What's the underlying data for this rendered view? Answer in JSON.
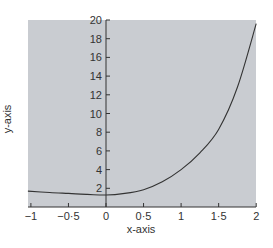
{
  "chart_data": {
    "type": "line",
    "title": "",
    "xlabel": "x-axis",
    "ylabel": "y-axis",
    "xlim": [
      -1,
      2
    ],
    "ylim": [
      0,
      20
    ],
    "grid": false,
    "legend": null,
    "background_color": "#c9ccd1",
    "line_color": "#333333",
    "x_ticks": [
      {
        "value": -1,
        "label": "−1"
      },
      {
        "value": -0.5,
        "label": "−0·5"
      },
      {
        "value": 0,
        "label": "0"
      },
      {
        "value": 0.5,
        "label": "0·5"
      },
      {
        "value": 1,
        "label": "1"
      },
      {
        "value": 1.5,
        "label": "1·5"
      },
      {
        "value": 2,
        "label": "2"
      }
    ],
    "y_ticks": [
      {
        "value": 2,
        "label": "2"
      },
      {
        "value": 4,
        "label": "4"
      },
      {
        "value": 6,
        "label": "6"
      },
      {
        "value": 8,
        "label": "8"
      },
      {
        "value": 10,
        "label": "10"
      },
      {
        "value": 12,
        "label": "12"
      },
      {
        "value": 14,
        "label": "14"
      },
      {
        "value": 16,
        "label": "16"
      },
      {
        "value": 18,
        "label": "18"
      },
      {
        "value": 20,
        "label": "20"
      }
    ],
    "series": [
      {
        "name": "curve",
        "x": [
          -1.04,
          -0.75,
          -0.5,
          -0.25,
          0,
          0.25,
          0.5,
          0.75,
          1,
          1.25,
          1.5,
          1.75,
          2
        ],
        "y": [
          1.7,
          1.55,
          1.45,
          1.35,
          1.28,
          1.45,
          1.85,
          2.7,
          4.0,
          5.8,
          8.3,
          12.8,
          19.6
        ]
      }
    ]
  }
}
